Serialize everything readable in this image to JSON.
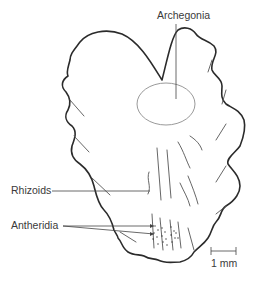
{
  "figure": {
    "labels": {
      "archegonia": "Archegonia",
      "rhizoids": "Rhizoids",
      "antheridia": "Antheridia"
    },
    "scale_bar": {
      "label": "1 mm"
    },
    "colors": {
      "outline": "#2b2b2b",
      "veins": "#555555",
      "archegonia_ellipse": "#9a9a9a",
      "text": "#3a3a3a",
      "background": "#ffffff"
    }
  }
}
